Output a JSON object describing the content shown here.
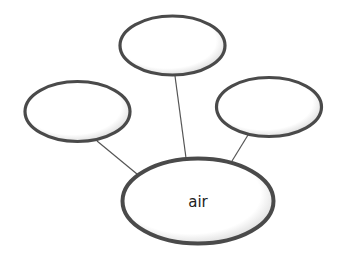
{
  "diagram": {
    "type": "concept-web",
    "center": {
      "label": "air"
    },
    "outer_nodes": [
      {
        "position": "top",
        "label": ""
      },
      {
        "position": "left",
        "label": ""
      },
      {
        "position": "right",
        "label": ""
      }
    ]
  },
  "colors": {
    "stroke": "#4a4a4a",
    "line": "#555555",
    "fill": "#ffffff"
  }
}
